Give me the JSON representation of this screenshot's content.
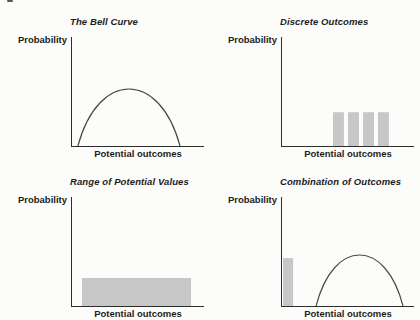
{
  "colors": {
    "background": "#fcfcfb",
    "axis": "#2e2e2e",
    "curve": "#4a4a4a",
    "bar_fill": "#c7c7c7",
    "text": "#1c1c1c"
  },
  "chart_data": [
    {
      "type": "line",
      "title": "The Bell Curve",
      "xlabel": "Potential outcomes",
      "ylabel": "Probability",
      "axis_ticks": "none",
      "units": "fractions of plot area: x from y-axis (0) to axis end (1), h = height above x-axis",
      "elements": [
        {
          "kind": "dome",
          "x0": 0.045,
          "x1": 0.818,
          "h": 0.523
        }
      ]
    },
    {
      "type": "bar",
      "title": "Discrete Outcomes",
      "xlabel": "Potential outcomes",
      "ylabel": "Probability",
      "axis_ticks": "none",
      "units": "fractions of plot area: x from y-axis (0) to axis end (1), h = height above x-axis",
      "elements": [
        {
          "kind": "bars",
          "items": [
            {
              "x": 0.386,
              "w": 0.083,
              "h": 0.31
            },
            {
              "x": 0.5,
              "w": 0.083,
              "h": 0.31
            },
            {
              "x": 0.614,
              "w": 0.083,
              "h": 0.31
            },
            {
              "x": 0.727,
              "w": 0.083,
              "h": 0.31
            }
          ]
        }
      ]
    },
    {
      "type": "area",
      "title": "Range of Potential Values",
      "xlabel": "Potential outcomes",
      "ylabel": "Probability",
      "axis_ticks": "none",
      "units": "fractions of plot area: x from y-axis (0) to axis end (1), h = height above x-axis",
      "elements": [
        {
          "kind": "bars",
          "items": [
            {
              "x": 0.076,
              "w": 0.826,
              "h": 0.257
            }
          ]
        }
      ]
    },
    {
      "type": "composite",
      "title": "Combination of Outcomes",
      "xlabel": "Potential outcomes",
      "ylabel": "Probability",
      "axis_ticks": "none",
      "units": "fractions of plot area: x from y-axis (0) to axis end (1), h = height above x-axis",
      "elements": [
        {
          "kind": "bars",
          "items": [
            {
              "x": 0.008,
              "w": 0.076,
              "h": 0.44
            }
          ]
        },
        {
          "kind": "dome",
          "x0": 0.258,
          "x1": 0.917,
          "h": 0.468
        }
      ]
    }
  ]
}
